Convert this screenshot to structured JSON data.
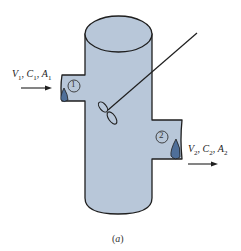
{
  "figure": {
    "caption_open": "(",
    "caption_letter": "a",
    "caption_close": ")",
    "colors": {
      "vessel_fill": "#b8c7d9",
      "outline": "#1f1f1f",
      "drop_fill": "#4f6f99",
      "background": "#ffffff"
    },
    "inlet": {
      "station": "1",
      "vars": [
        {
          "sym": "V",
          "sub": "1",
          "sep": ", "
        },
        {
          "sym": "C",
          "sub": "1",
          "sep": ", "
        },
        {
          "sym": "A",
          "sub": "1",
          "sep": ""
        }
      ],
      "flow_direction": "into vessel"
    },
    "outlet": {
      "station": "2",
      "vars": [
        {
          "sym": "V",
          "sub": "2",
          "sep": ", "
        },
        {
          "sym": "C",
          "sub": "2",
          "sep": ", "
        },
        {
          "sym": "A",
          "sub": "2",
          "sep": ""
        }
      ],
      "flow_direction": "out of vessel"
    },
    "components": [
      "cylindrical-vessel",
      "inlet-pipe",
      "outlet-pipe",
      "stirrer-shaft",
      "propeller-impeller"
    ]
  }
}
